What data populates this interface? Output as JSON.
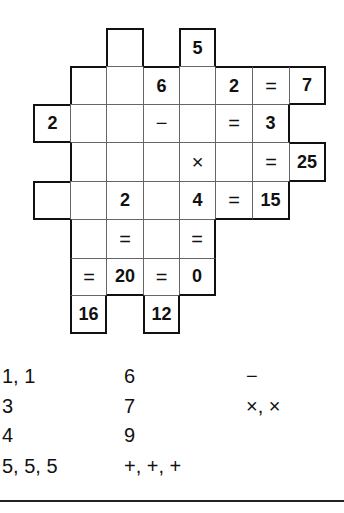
{
  "puzzle": {
    "col_x": [
      33,
      70,
      106,
      143,
      179,
      215,
      252,
      289,
      325
    ],
    "row_y": [
      28,
      66,
      104,
      142,
      181,
      219,
      258,
      295,
      333
    ],
    "cells": [
      {
        "r": 0,
        "c": 2,
        "v": ""
      },
      {
        "r": 0,
        "c": 4,
        "v": "5"
      },
      {
        "r": 1,
        "c": 1,
        "v": ""
      },
      {
        "r": 1,
        "c": 2,
        "v": ""
      },
      {
        "r": 1,
        "c": 3,
        "v": "6"
      },
      {
        "r": 1,
        "c": 4,
        "v": ""
      },
      {
        "r": 1,
        "c": 5,
        "v": "2"
      },
      {
        "r": 1,
        "c": 6,
        "v": "=",
        "op": true
      },
      {
        "r": 1,
        "c": 7,
        "v": "7"
      },
      {
        "r": 2,
        "c": 0,
        "v": "2"
      },
      {
        "r": 2,
        "c": 1,
        "v": ""
      },
      {
        "r": 2,
        "c": 2,
        "v": ""
      },
      {
        "r": 2,
        "c": 3,
        "v": "−",
        "op": true
      },
      {
        "r": 2,
        "c": 4,
        "v": ""
      },
      {
        "r": 2,
        "c": 5,
        "v": "=",
        "op": true
      },
      {
        "r": 2,
        "c": 6,
        "v": "3"
      },
      {
        "r": 3,
        "c": 1,
        "v": ""
      },
      {
        "r": 3,
        "c": 2,
        "v": ""
      },
      {
        "r": 3,
        "c": 3,
        "v": ""
      },
      {
        "r": 3,
        "c": 4,
        "v": "×",
        "op": true
      },
      {
        "r": 3,
        "c": 5,
        "v": ""
      },
      {
        "r": 3,
        "c": 6,
        "v": "=",
        "op": true
      },
      {
        "r": 3,
        "c": 7,
        "v": "25"
      },
      {
        "r": 4,
        "c": 0,
        "v": ""
      },
      {
        "r": 4,
        "c": 1,
        "v": ""
      },
      {
        "r": 4,
        "c": 2,
        "v": "2"
      },
      {
        "r": 4,
        "c": 3,
        "v": ""
      },
      {
        "r": 4,
        "c": 4,
        "v": "4"
      },
      {
        "r": 4,
        "c": 5,
        "v": "=",
        "op": true
      },
      {
        "r": 4,
        "c": 6,
        "v": "15"
      },
      {
        "r": 5,
        "c": 1,
        "v": ""
      },
      {
        "r": 5,
        "c": 2,
        "v": "=",
        "op": true
      },
      {
        "r": 5,
        "c": 3,
        "v": ""
      },
      {
        "r": 5,
        "c": 4,
        "v": "=",
        "op": true
      },
      {
        "r": 6,
        "c": 1,
        "v": "=",
        "op": true
      },
      {
        "r": 6,
        "c": 2,
        "v": "20"
      },
      {
        "r": 6,
        "c": 3,
        "v": "=",
        "op": true
      },
      {
        "r": 6,
        "c": 4,
        "v": "0"
      },
      {
        "r": 7,
        "c": 1,
        "v": "16"
      },
      {
        "r": 7,
        "c": 3,
        "v": "12"
      }
    ]
  },
  "pieces": {
    "columns": [
      {
        "x": 2,
        "items": [
          "1, 1",
          "3",
          "4",
          "5, 5, 5"
        ]
      },
      {
        "x": 124,
        "items": [
          "6",
          "7",
          "9",
          "+, +, +"
        ]
      },
      {
        "x": 246,
        "items": [
          "−",
          "×, ×"
        ]
      }
    ],
    "row_y": [
      364,
      394,
      423,
      454
    ]
  }
}
